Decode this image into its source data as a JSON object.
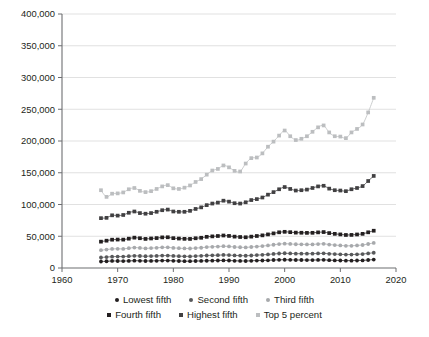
{
  "chart_data": {
    "type": "line",
    "title": "",
    "subtitle": "",
    "xlabel": "",
    "ylabel": "",
    "xlim": [
      1960,
      2020
    ],
    "ylim": [
      0,
      400000
    ],
    "grid": true,
    "legend_position": "bottom",
    "x_ticks": [
      "1960",
      "1970",
      "1980",
      "1990",
      "2000",
      "2010",
      "2020"
    ],
    "x_tick_values": [
      1960,
      1970,
      1980,
      1990,
      2000,
      2010,
      2020
    ],
    "y_ticks": [
      "0",
      "50,000",
      "100,000",
      "150,000",
      "200,000",
      "250,000",
      "300,000",
      "350,000",
      "400,000"
    ],
    "y_tick_values": [
      0,
      50000,
      100000,
      150000,
      200000,
      250000,
      300000,
      350000,
      400000
    ],
    "x": [
      1967,
      1968,
      1969,
      1970,
      1971,
      1972,
      1973,
      1974,
      1975,
      1976,
      1977,
      1978,
      1979,
      1980,
      1981,
      1982,
      1983,
      1984,
      1985,
      1986,
      1987,
      1988,
      1989,
      1990,
      1991,
      1992,
      1993,
      1994,
      1995,
      1996,
      1997,
      1998,
      1999,
      2000,
      2001,
      2002,
      2003,
      2004,
      2005,
      2006,
      2007,
      2008,
      2009,
      2010,
      2011,
      2012,
      2013,
      2014,
      2015,
      2016
    ],
    "series": [
      {
        "name": "Lowest fifth",
        "color": "#231f20",
        "marker": "circle",
        "values": [
          10200,
          10600,
          11100,
          11000,
          10900,
          11200,
          11500,
          11300,
          11000,
          11200,
          11300,
          11700,
          11700,
          11300,
          11000,
          10800,
          10700,
          11000,
          11100,
          11400,
          11600,
          11800,
          12000,
          11800,
          11300,
          11100,
          11000,
          11300,
          11700,
          11800,
          12100,
          12600,
          12900,
          13000,
          12800,
          12600,
          12600,
          12500,
          12500,
          12700,
          12800,
          12400,
          12000,
          11800,
          11600,
          11600,
          11800,
          12000,
          12600,
          13200
        ]
      },
      {
        "name": "Second fifth",
        "color": "#58595b",
        "marker": "circle",
        "values": [
          16500,
          17200,
          17900,
          18000,
          18000,
          18600,
          19200,
          18900,
          18500,
          18800,
          19000,
          19500,
          19600,
          19000,
          18700,
          18400,
          18300,
          18800,
          19100,
          19700,
          20000,
          20200,
          20600,
          20300,
          19800,
          19500,
          19300,
          19700,
          20300,
          20700,
          21400,
          22100,
          22800,
          23200,
          22900,
          22600,
          22600,
          22500,
          22600,
          22900,
          23100,
          22400,
          21900,
          21500,
          21100,
          21200,
          21500,
          22000,
          23000,
          24000
        ]
      },
      {
        "name": "Third fifth",
        "color": "#a7a9ac",
        "marker": "circle",
        "values": [
          28000,
          29000,
          30100,
          30200,
          30100,
          31200,
          32200,
          31600,
          30900,
          31300,
          31700,
          32500,
          32600,
          31600,
          31200,
          30800,
          30700,
          31400,
          31900,
          32900,
          33400,
          33800,
          34400,
          33900,
          33100,
          32700,
          32400,
          33100,
          33800,
          34500,
          35500,
          36600,
          37700,
          38300,
          37900,
          37400,
          37300,
          37100,
          37200,
          37700,
          38000,
          36900,
          36100,
          35500,
          34900,
          35000,
          35500,
          36200,
          37800,
          39500
        ]
      },
      {
        "name": "Fourth fifth",
        "color": "#231f20",
        "marker": "square",
        "values": [
          41500,
          43000,
          44600,
          44800,
          44700,
          46200,
          47800,
          46900,
          45800,
          46500,
          47100,
          48200,
          48400,
          47000,
          46400,
          45900,
          45800,
          46800,
          47600,
          49100,
          49800,
          50400,
          51200,
          50500,
          49400,
          48800,
          48400,
          49400,
          50400,
          51400,
          52900,
          54500,
          56200,
          57000,
          56400,
          55700,
          55500,
          55300,
          55400,
          56100,
          56600,
          55000,
          53800,
          52900,
          52000,
          52100,
          52800,
          53800,
          56200,
          58700
        ]
      },
      {
        "name": "Highest fifth",
        "color": "#414042",
        "marker": "square",
        "values": [
          78500,
          79000,
          83000,
          82500,
          83500,
          87000,
          89000,
          86500,
          85500,
          86500,
          88500,
          91000,
          92000,
          89000,
          88500,
          88500,
          90000,
          93000,
          95500,
          99000,
          101500,
          103000,
          106000,
          104500,
          102000,
          101500,
          103500,
          107000,
          108500,
          111000,
          115500,
          119500,
          124000,
          127500,
          124500,
          122000,
          122500,
          123500,
          126000,
          128500,
          129500,
          125000,
          122500,
          122000,
          121000,
          124000,
          126000,
          129000,
          137000,
          145000
        ]
      },
      {
        "name": "Top 5 percent",
        "color": "#bcbec0",
        "marker": "square",
        "values": [
          122500,
          112000,
          117000,
          117500,
          119000,
          124000,
          126000,
          121500,
          119500,
          121000,
          124500,
          128500,
          130500,
          125500,
          124500,
          126500,
          130000,
          135500,
          140000,
          147000,
          153500,
          156000,
          161500,
          158500,
          153000,
          152000,
          164500,
          173000,
          174000,
          180500,
          191000,
          199000,
          208500,
          216500,
          207500,
          201500,
          203500,
          207500,
          214500,
          221500,
          224500,
          213500,
          207500,
          207000,
          204500,
          213500,
          219000,
          226000,
          245000,
          268000
        ]
      }
    ]
  },
  "legend": {
    "rows": [
      [
        {
          "label": "Lowest fifth",
          "color": "#231f20",
          "marker": "circle"
        },
        {
          "label": "Second fifth",
          "color": "#58595b",
          "marker": "circle"
        },
        {
          "label": "Third fifth",
          "color": "#a7a9ac",
          "marker": "circle"
        }
      ],
      [
        {
          "label": "Fourth fifth",
          "color": "#231f20",
          "marker": "square"
        },
        {
          "label": "Highest fifth",
          "color": "#414042",
          "marker": "square"
        },
        {
          "label": "Top 5 percent",
          "color": "#bcbec0",
          "marker": "square"
        }
      ]
    ]
  },
  "colors": {
    "background": "#ffffff",
    "gridline": "#d9d9d9",
    "axis": "#6d6e71",
    "text": "#231f20"
  }
}
